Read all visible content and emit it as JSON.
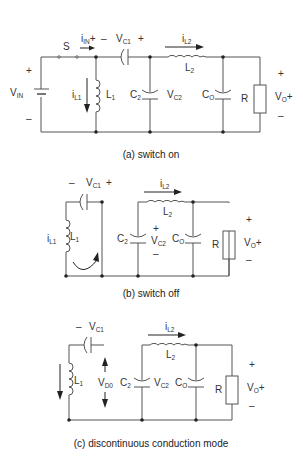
{
  "figure": {
    "panels": [
      {
        "id": "a",
        "caption": "(a) switch on",
        "labels": {
          "switch": "S",
          "iin_main": "i",
          "iin_sub": "IN",
          "iin_plus": "+",
          "vc1_minus": "–",
          "vc1_main": "V",
          "vc1_sub": "C1",
          "vc1_plus": "+",
          "il2_main": "i",
          "il2_sub": "L2",
          "l2_main": "L",
          "l2_sub": "2",
          "vin_plus": "+",
          "vin_main": "V",
          "vin_sub": "IN",
          "vin_minus": "–",
          "il1_main": "i",
          "il1_sub": "L1",
          "l1_main": "L",
          "l1_sub": "1",
          "c2_main": "C",
          "c2_sub": "2",
          "vc2_main": "V",
          "vc2_sub": "C2",
          "co_main": "C",
          "co_sub": "O",
          "r": "R",
          "vo_plus_top": "+",
          "vo_main": "V",
          "vo_sub": "O",
          "vo_plus": "+",
          "vo_minus": "–"
        }
      },
      {
        "id": "b",
        "caption": "(b) switch off",
        "labels": {
          "vc1_minus": "–",
          "vc1_main": "V",
          "vc1_sub": "C1",
          "vc1_plus": "+",
          "il2_main": "i",
          "il2_sub": "L2",
          "l2_main": "L",
          "l2_sub": "2",
          "il1_main": "i",
          "il1_sub": "L1",
          "l1_main": "L",
          "l1_sub": "1",
          "c2_main": "C",
          "c2_sub": "2",
          "vc2_plus": "+",
          "vc2_main": "V",
          "vc2_sub": "C2",
          "vc2_minus": "–",
          "co_main": "C",
          "co_sub": "O",
          "r": "R",
          "vo_plus_top": "+",
          "vo_main": "V",
          "vo_sub": "O",
          "vo_plus": "+",
          "vo_minus": "–"
        }
      },
      {
        "id": "c",
        "caption": "(c) discontinuous conduction mode",
        "labels": {
          "vc1_minus": "–",
          "vc1_main": "V",
          "vc1_sub": "C1",
          "il2_main": "i",
          "il2_sub": "L2",
          "l2_main": "L",
          "l2_sub": "2",
          "l1_main": "L",
          "l1_sub": "1",
          "vd0_main": "V",
          "vd0_sub": "D0",
          "c2_main": "C",
          "c2_sub": "2",
          "vc2_main": "V",
          "vc2_sub": "C2",
          "co_main": "C",
          "co_sub": "O",
          "r": "R",
          "vo_plus_top": "+",
          "vo_main": "V",
          "vo_sub": "O",
          "vo_plus": "+",
          "vo_minus": "–"
        }
      }
    ]
  }
}
